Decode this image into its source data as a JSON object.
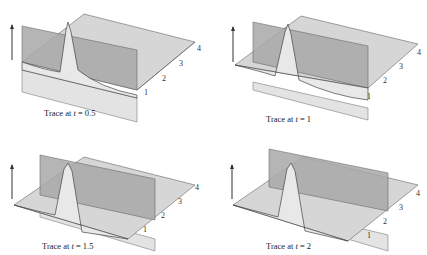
{
  "figure": {
    "panels": [
      {
        "caption_prefix": "Trace at ",
        "var": "t",
        "eq": " = ",
        "value": "0.5",
        "ticks": [
          "1",
          "2",
          "3",
          "4"
        ]
      },
      {
        "caption_prefix": "Trace at ",
        "var": "t",
        "eq": " = ",
        "value": "1",
        "ticks": [
          "1",
          "2",
          "3",
          "4"
        ]
      },
      {
        "caption_prefix": "Trace at ",
        "var": "t",
        "eq": " = ",
        "value": "1.5",
        "ticks": [
          "1",
          "2",
          "3",
          "4"
        ]
      },
      {
        "caption_prefix": "Trace at ",
        "var": "t",
        "eq": " = ",
        "value": "2",
        "ticks": [
          "1",
          "2",
          "3",
          "4"
        ]
      }
    ],
    "colors": {
      "surface": "#d6d6d6",
      "plane": "#a9a9a9",
      "lower_plane": "#e3e3e3",
      "line": "#555555"
    }
  }
}
